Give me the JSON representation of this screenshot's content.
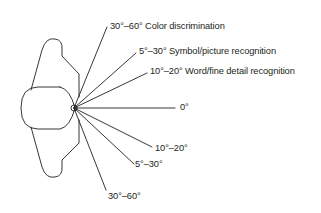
{
  "diagram": {
    "type": "visual-field-angles",
    "colors": {
      "stroke": "#231f20",
      "text": "#231f20",
      "background": "#ffffff"
    },
    "eye_point": [
      74,
      108
    ],
    "labels": {
      "upper_color": "30°–60° Color discrimination",
      "upper_symbol": "5°–30° Symbol/picture recognition",
      "upper_word": "10°–20° Word/fine detail recognition",
      "center": "0°",
      "lower_word": "10°–20°",
      "lower_symbol": "5°–30°",
      "lower_color": "30°–60°"
    }
  }
}
